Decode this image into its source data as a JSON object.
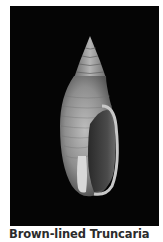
{
  "figure": {
    "caption": "Brown-lined Truncaria",
    "colors": {
      "background": "#050505",
      "shell_light": "#d8d8d8",
      "shell_mid": "#9a9a9a",
      "shell_dark": "#4a4a4a",
      "caption_text": "#2b2b2b"
    }
  }
}
